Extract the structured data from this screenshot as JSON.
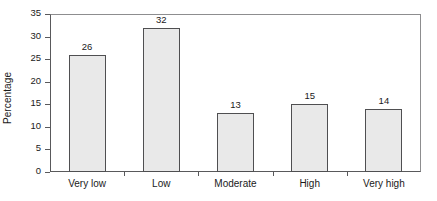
{
  "chart_data": {
    "type": "bar",
    "title": "",
    "subtitle": "",
    "xlabel": "",
    "ylabel": "Percentage",
    "categories": [
      "Very low",
      "Low",
      "Moderate",
      "High",
      "Very high"
    ],
    "values": [
      26,
      32,
      13,
      15,
      14
    ],
    "value_labels": [
      "26",
      "32",
      "13",
      "15",
      "14"
    ],
    "ylim": [
      0,
      35
    ],
    "ytick_step": 5,
    "yticks": [
      0,
      5,
      10,
      15,
      20,
      25,
      30,
      35
    ],
    "ytick_labels": [
      "0",
      "5",
      "10",
      "15",
      "20",
      "25",
      "30",
      "35"
    ],
    "grid": false,
    "legend": null,
    "bar_fill_color": "#e9e9e9",
    "bar_border_color": "#4f4f51",
    "axis_color": "#59595b",
    "background_color": "#ffffff",
    "text_color": "#1a1a1a"
  }
}
